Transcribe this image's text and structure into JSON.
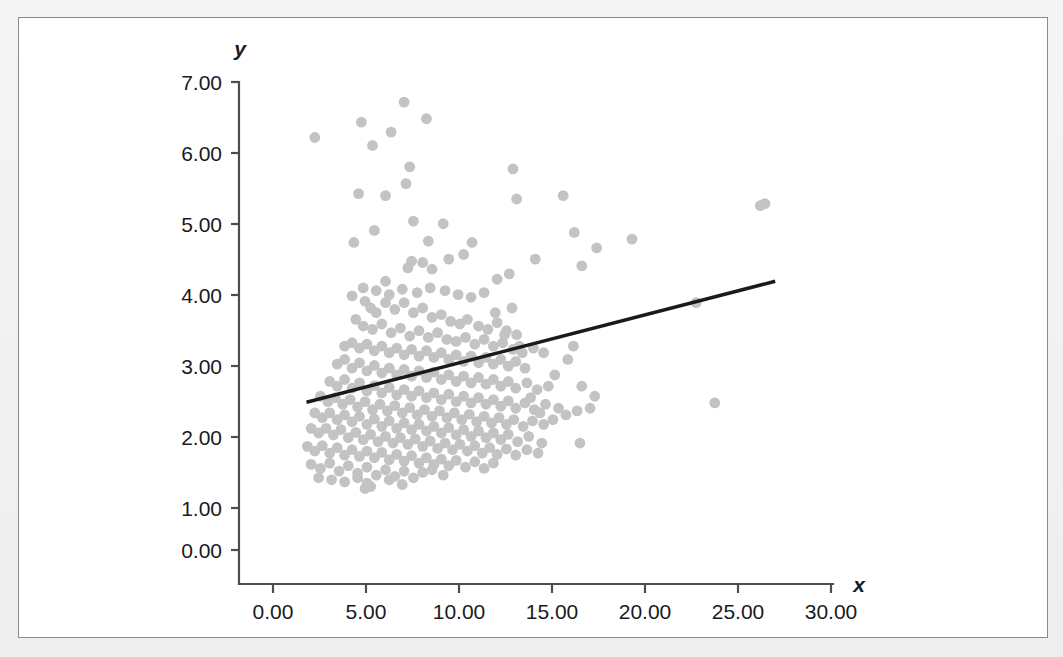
{
  "chart_data": {
    "type": "scatter",
    "title": "",
    "xlabel": "x",
    "ylabel": "y",
    "xlim": [
      -1.8,
      30.0
    ],
    "ylim": [
      0.0,
      7.0
    ],
    "x_ticks": [
      "0.00",
      "5.00",
      "10.00",
      "15.00",
      "20.00",
      "25.00",
      "30.00"
    ],
    "x_tick_values": [
      0,
      5,
      10,
      15,
      20,
      25,
      30
    ],
    "y_ticks": [
      "0.00",
      "1.00",
      "2.00",
      "3.00",
      "4.00",
      "5.00",
      "6.00",
      "7.00"
    ],
    "y_tick_values": [
      0,
      1,
      2,
      3,
      4,
      5,
      6,
      7
    ],
    "grid": false,
    "legend": "none",
    "point_color": "#c3c3c3",
    "point_radius": 5.4,
    "trendline": {
      "type": "linear",
      "color": "#1a1a1a",
      "x_start": 1.8,
      "y_start": 2.21,
      "x_end": 27.0,
      "y_end": 4.02
    },
    "points": [
      [
        2.25,
        6.17
      ],
      [
        4.6,
        5.33
      ],
      [
        4.75,
        6.4
      ],
      [
        7.05,
        6.7
      ],
      [
        8.25,
        6.45
      ],
      [
        6.35,
        6.25
      ],
      [
        5.35,
        6.05
      ],
      [
        7.35,
        5.73
      ],
      [
        7.15,
        5.48
      ],
      [
        6.05,
        5.3
      ],
      [
        12.9,
        5.7
      ],
      [
        13.1,
        5.25
      ],
      [
        15.6,
        5.3
      ],
      [
        26.2,
        5.15
      ],
      [
        26.45,
        5.18
      ],
      [
        4.35,
        4.6
      ],
      [
        5.45,
        4.78
      ],
      [
        7.55,
        4.92
      ],
      [
        9.15,
        4.88
      ],
      [
        8.35,
        4.62
      ],
      [
        10.7,
        4.6
      ],
      [
        10.25,
        4.42
      ],
      [
        9.45,
        4.35
      ],
      [
        8.05,
        4.3
      ],
      [
        7.45,
        4.32
      ],
      [
        7.25,
        4.22
      ],
      [
        8.55,
        4.2
      ],
      [
        6.05,
        4.02
      ],
      [
        12.7,
        4.13
      ],
      [
        14.1,
        4.35
      ],
      [
        16.2,
        4.75
      ],
      [
        17.4,
        4.52
      ],
      [
        19.3,
        4.65
      ],
      [
        16.6,
        4.25
      ],
      [
        22.75,
        3.7
      ],
      [
        23.75,
        2.2
      ],
      [
        16.5,
        1.6
      ],
      [
        4.95,
        3.72
      ],
      [
        5.25,
        3.62
      ],
      [
        5.55,
        3.55
      ],
      [
        6.05,
        3.7
      ],
      [
        6.55,
        3.6
      ],
      [
        7.05,
        3.7
      ],
      [
        7.55,
        3.55
      ],
      [
        8.05,
        3.62
      ],
      [
        8.55,
        3.48
      ],
      [
        9.05,
        3.52
      ],
      [
        9.55,
        3.42
      ],
      [
        10.05,
        3.38
      ],
      [
        10.45,
        3.45
      ],
      [
        11.05,
        3.35
      ],
      [
        11.55,
        3.3
      ],
      [
        12.05,
        3.4
      ],
      [
        12.55,
        3.28
      ],
      [
        13.1,
        3.22
      ],
      [
        4.45,
        3.45
      ],
      [
        4.85,
        3.35
      ],
      [
        5.35,
        3.3
      ],
      [
        5.85,
        3.38
      ],
      [
        6.35,
        3.25
      ],
      [
        6.85,
        3.32
      ],
      [
        7.35,
        3.2
      ],
      [
        7.85,
        3.28
      ],
      [
        8.35,
        3.18
      ],
      [
        8.85,
        3.25
      ],
      [
        9.35,
        3.15
      ],
      [
        9.85,
        3.12
      ],
      [
        10.35,
        3.18
      ],
      [
        10.85,
        3.08
      ],
      [
        11.35,
        3.15
      ],
      [
        11.85,
        3.05
      ],
      [
        12.35,
        3.1
      ],
      [
        12.9,
        3.0
      ],
      [
        13.4,
        2.95
      ],
      [
        14.0,
        3.02
      ],
      [
        3.85,
        3.05
      ],
      [
        4.25,
        3.1
      ],
      [
        4.65,
        3.02
      ],
      [
        5.05,
        3.08
      ],
      [
        5.45,
        2.98
      ],
      [
        5.85,
        3.05
      ],
      [
        6.25,
        2.95
      ],
      [
        6.65,
        3.02
      ],
      [
        7.05,
        2.92
      ],
      [
        7.45,
        3.0
      ],
      [
        7.85,
        2.9
      ],
      [
        8.25,
        2.98
      ],
      [
        8.65,
        2.88
      ],
      [
        9.05,
        2.95
      ],
      [
        9.45,
        2.85
      ],
      [
        9.85,
        2.92
      ],
      [
        10.25,
        2.82
      ],
      [
        10.65,
        2.9
      ],
      [
        11.05,
        2.8
      ],
      [
        11.45,
        2.88
      ],
      [
        11.85,
        2.78
      ],
      [
        12.25,
        2.85
      ],
      [
        12.65,
        2.75
      ],
      [
        13.05,
        2.82
      ],
      [
        13.55,
        2.72
      ],
      [
        3.45,
        2.78
      ],
      [
        3.85,
        2.85
      ],
      [
        4.25,
        2.72
      ],
      [
        4.65,
        2.8
      ],
      [
        5.05,
        2.68
      ],
      [
        5.45,
        2.76
      ],
      [
        5.85,
        2.65
      ],
      [
        6.25,
        2.72
      ],
      [
        6.65,
        2.62
      ],
      [
        7.05,
        2.7
      ],
      [
        7.45,
        2.6
      ],
      [
        7.85,
        2.68
      ],
      [
        8.25,
        2.58
      ],
      [
        8.65,
        2.66
      ],
      [
        9.05,
        2.55
      ],
      [
        9.45,
        2.62
      ],
      [
        9.85,
        2.52
      ],
      [
        10.25,
        2.6
      ],
      [
        10.65,
        2.5
      ],
      [
        11.05,
        2.58
      ],
      [
        11.45,
        2.48
      ],
      [
        11.85,
        2.55
      ],
      [
        12.25,
        2.45
      ],
      [
        12.65,
        2.52
      ],
      [
        13.05,
        2.42
      ],
      [
        13.65,
        2.5
      ],
      [
        14.2,
        2.4
      ],
      [
        14.8,
        2.45
      ],
      [
        16.6,
        2.45
      ],
      [
        17.3,
        2.3
      ],
      [
        3.05,
        2.52
      ],
      [
        3.45,
        2.45
      ],
      [
        3.85,
        2.55
      ],
      [
        4.25,
        2.42
      ],
      [
        4.65,
        2.5
      ],
      [
        5.05,
        2.38
      ],
      [
        5.45,
        2.46
      ],
      [
        5.85,
        2.35
      ],
      [
        6.25,
        2.43
      ],
      [
        6.65,
        2.32
      ],
      [
        7.05,
        2.4
      ],
      [
        7.45,
        2.3
      ],
      [
        7.85,
        2.38
      ],
      [
        8.25,
        2.28
      ],
      [
        8.65,
        2.35
      ],
      [
        9.05,
        2.25
      ],
      [
        9.45,
        2.33
      ],
      [
        9.85,
        2.22
      ],
      [
        10.25,
        2.3
      ],
      [
        10.65,
        2.2
      ],
      [
        11.05,
        2.28
      ],
      [
        11.45,
        2.18
      ],
      [
        11.85,
        2.25
      ],
      [
        12.25,
        2.15
      ],
      [
        12.65,
        2.23
      ],
      [
        13.05,
        2.12
      ],
      [
        13.55,
        2.2
      ],
      [
        14.05,
        2.1
      ],
      [
        14.65,
        2.18
      ],
      [
        15.35,
        2.12
      ],
      [
        2.55,
        2.3
      ],
      [
        2.95,
        2.22
      ],
      [
        3.35,
        2.28
      ],
      [
        3.75,
        2.18
      ],
      [
        4.15,
        2.25
      ],
      [
        4.55,
        2.14
      ],
      [
        4.95,
        2.22
      ],
      [
        5.35,
        2.1
      ],
      [
        5.75,
        2.18
      ],
      [
        6.15,
        2.08
      ],
      [
        6.55,
        2.16
      ],
      [
        6.95,
        2.05
      ],
      [
        7.35,
        2.13
      ],
      [
        7.75,
        2.02
      ],
      [
        8.15,
        2.1
      ],
      [
        8.55,
        2.0
      ],
      [
        8.95,
        2.08
      ],
      [
        9.35,
        1.98
      ],
      [
        9.75,
        2.05
      ],
      [
        10.15,
        1.95
      ],
      [
        10.55,
        2.03
      ],
      [
        10.95,
        1.92
      ],
      [
        11.35,
        2.0
      ],
      [
        11.75,
        1.9
      ],
      [
        12.15,
        1.98
      ],
      [
        12.55,
        1.88
      ],
      [
        12.95,
        1.95
      ],
      [
        13.45,
        1.85
      ],
      [
        13.95,
        1.93
      ],
      [
        14.55,
        1.88
      ],
      [
        2.25,
        2.05
      ],
      [
        2.65,
        1.98
      ],
      [
        3.05,
        2.05
      ],
      [
        3.45,
        1.95
      ],
      [
        3.85,
        2.02
      ],
      [
        4.25,
        1.92
      ],
      [
        4.65,
        2.0
      ],
      [
        5.05,
        1.88
      ],
      [
        5.45,
        1.96
      ],
      [
        5.85,
        1.85
      ],
      [
        6.25,
        1.93
      ],
      [
        6.65,
        1.82
      ],
      [
        7.05,
        1.9
      ],
      [
        7.45,
        1.8
      ],
      [
        7.85,
        1.88
      ],
      [
        8.25,
        1.78
      ],
      [
        8.65,
        1.85
      ],
      [
        9.05,
        1.75
      ],
      [
        9.45,
        1.83
      ],
      [
        9.85,
        1.72
      ],
      [
        10.25,
        1.8
      ],
      [
        10.65,
        1.7
      ],
      [
        11.05,
        1.78
      ],
      [
        11.45,
        1.68
      ],
      [
        11.85,
        1.75
      ],
      [
        12.25,
        1.65
      ],
      [
        12.65,
        1.73
      ],
      [
        13.15,
        1.62
      ],
      [
        13.75,
        1.7
      ],
      [
        14.45,
        1.6
      ],
      [
        2.05,
        1.82
      ],
      [
        2.45,
        1.75
      ],
      [
        2.85,
        1.82
      ],
      [
        3.25,
        1.72
      ],
      [
        3.65,
        1.8
      ],
      [
        4.05,
        1.68
      ],
      [
        4.45,
        1.76
      ],
      [
        4.85,
        1.65
      ],
      [
        5.25,
        1.73
      ],
      [
        5.65,
        1.62
      ],
      [
        6.05,
        1.7
      ],
      [
        6.45,
        1.6
      ],
      [
        6.85,
        1.68
      ],
      [
        7.25,
        1.58
      ],
      [
        7.65,
        1.66
      ],
      [
        8.05,
        1.55
      ],
      [
        8.45,
        1.63
      ],
      [
        8.85,
        1.52
      ],
      [
        9.25,
        1.6
      ],
      [
        9.65,
        1.5
      ],
      [
        10.05,
        1.58
      ],
      [
        10.45,
        1.48
      ],
      [
        10.85,
        1.56
      ],
      [
        11.25,
        1.45
      ],
      [
        11.65,
        1.53
      ],
      [
        12.05,
        1.43
      ],
      [
        12.55,
        1.51
      ],
      [
        13.05,
        1.42
      ],
      [
        13.65,
        1.5
      ],
      [
        14.25,
        1.45
      ],
      [
        1.85,
        1.55
      ],
      [
        2.25,
        1.48
      ],
      [
        2.65,
        1.56
      ],
      [
        3.05,
        1.45
      ],
      [
        3.45,
        1.53
      ],
      [
        3.85,
        1.42
      ],
      [
        4.25,
        1.5
      ],
      [
        4.65,
        1.4
      ],
      [
        5.05,
        1.48
      ],
      [
        5.45,
        1.38
      ],
      [
        5.85,
        1.46
      ],
      [
        6.25,
        1.35
      ],
      [
        6.65,
        1.43
      ],
      [
        7.05,
        1.33
      ],
      [
        7.45,
        1.41
      ],
      [
        7.85,
        1.3
      ],
      [
        8.25,
        1.38
      ],
      [
        8.65,
        1.28
      ],
      [
        9.05,
        1.36
      ],
      [
        9.45,
        1.26
      ],
      [
        9.85,
        1.34
      ],
      [
        10.35,
        1.24
      ],
      [
        10.85,
        1.32
      ],
      [
        11.35,
        1.22
      ],
      [
        11.85,
        1.3
      ],
      [
        2.05,
        1.28
      ],
      [
        2.55,
        1.22
      ],
      [
        3.05,
        1.3
      ],
      [
        3.55,
        1.18
      ],
      [
        4.05,
        1.26
      ],
      [
        4.55,
        1.15
      ],
      [
        5.05,
        1.24
      ],
      [
        5.55,
        1.12
      ],
      [
        6.05,
        1.2
      ],
      [
        6.55,
        1.1
      ],
      [
        7.05,
        1.18
      ],
      [
        7.55,
        1.08
      ],
      [
        8.05,
        1.16
      ],
      [
        8.55,
        1.2
      ],
      [
        9.15,
        1.12
      ],
      [
        2.45,
        1.08
      ],
      [
        3.15,
        1.05
      ],
      [
        3.85,
        1.02
      ],
      [
        4.55,
        1.08
      ],
      [
        5.25,
        0.95
      ],
      [
        5.05,
        1.0
      ],
      [
        6.25,
        1.05
      ],
      [
        6.95,
        0.98
      ],
      [
        4.95,
        0.92
      ],
      [
        12.45,
        3.22
      ],
      [
        13.25,
        3.05
      ],
      [
        14.55,
        2.95
      ],
      [
        15.15,
        2.62
      ],
      [
        15.85,
        2.85
      ],
      [
        16.15,
        3.05
      ],
      [
        13.85,
        2.28
      ],
      [
        14.35,
        2.05
      ],
      [
        15.05,
        1.95
      ],
      [
        15.75,
        2.02
      ],
      [
        16.35,
        2.08
      ],
      [
        17.05,
        2.12
      ],
      [
        12.05,
        4.05
      ],
      [
        11.35,
        3.85
      ],
      [
        10.65,
        3.78
      ],
      [
        9.95,
        3.82
      ],
      [
        9.25,
        3.88
      ],
      [
        8.45,
        3.92
      ],
      [
        7.75,
        3.85
      ],
      [
        6.95,
        3.9
      ],
      [
        6.25,
        3.82
      ],
      [
        5.55,
        3.88
      ],
      [
        4.85,
        3.92
      ],
      [
        4.25,
        3.8
      ],
      [
        11.95,
        3.55
      ],
      [
        12.85,
        3.62
      ]
    ]
  },
  "axes": {
    "y_axis_label": "y",
    "x_axis_label": "x"
  }
}
